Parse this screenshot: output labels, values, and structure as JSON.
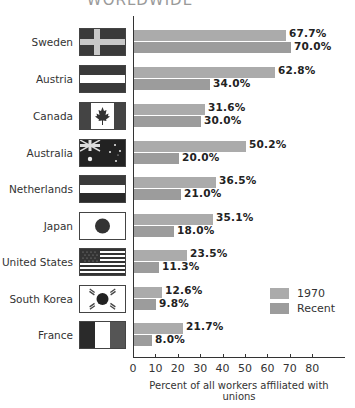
{
  "chart_data": {
    "type": "bar",
    "orientation": "horizontal",
    "title": "WORLDWIDE",
    "xlabel": "Percent of all workers affiliated with unions",
    "ylabel": "",
    "xlim": [
      0,
      90
    ],
    "xticks": [
      "0",
      "10",
      "20",
      "30",
      "40",
      "50",
      "60",
      "70",
      "80"
    ],
    "grid": false,
    "legend_position": "lower right",
    "categories": [
      "Sweden",
      "Austria",
      "Canada",
      "Australia",
      "Netherlands",
      "Japan",
      "United States",
      "South Korea",
      "France"
    ],
    "series": [
      {
        "name": "1970",
        "color": "#ababab",
        "values": [
          67.7,
          62.8,
          31.6,
          50.2,
          36.5,
          35.1,
          23.5,
          12.6,
          21.7
        ]
      },
      {
        "name": "Recent",
        "color": "#9c9c9c",
        "values": [
          70.0,
          34.0,
          30.0,
          20.0,
          21.0,
          18.0,
          11.3,
          9.8,
          8.0
        ]
      }
    ]
  },
  "title": "WORLDWIDE",
  "xlabel": "Percent of all workers affiliated with unions",
  "ticks": [
    "0",
    "10",
    "20",
    "30",
    "40",
    "50",
    "60",
    "70",
    "80"
  ],
  "legend": {
    "items": [
      {
        "label": "1970"
      },
      {
        "label": "Recent"
      }
    ]
  },
  "rows": [
    {
      "country": "Sweden",
      "flag": "sweden-flag-icon",
      "v1970": "67.7%",
      "vrecent": "70.0%"
    },
    {
      "country": "Austria",
      "flag": "austria-flag-icon",
      "v1970": "62.8%",
      "vrecent": "34.0%"
    },
    {
      "country": "Canada",
      "flag": "canada-flag-icon",
      "v1970": "31.6%",
      "vrecent": "30.0%"
    },
    {
      "country": "Australia",
      "flag": "australia-flag-icon",
      "v1970": "50.2%",
      "vrecent": "20.0%"
    },
    {
      "country": "Netherlands",
      "flag": "netherlands-flag-icon",
      "v1970": "36.5%",
      "vrecent": "21.0%"
    },
    {
      "country": "Japan",
      "flag": "japan-flag-icon",
      "v1970": "35.1%",
      "vrecent": "18.0%"
    },
    {
      "country": "United States",
      "flag": "united-states-flag-icon",
      "v1970": "23.5%",
      "vrecent": "11.3%"
    },
    {
      "country": "South Korea",
      "flag": "south-korea-flag-icon",
      "v1970": "12.6%",
      "vrecent": "9.8%"
    },
    {
      "country": "France",
      "flag": "france-flag-icon",
      "v1970": "21.7%",
      "vrecent": "8.0%"
    }
  ]
}
